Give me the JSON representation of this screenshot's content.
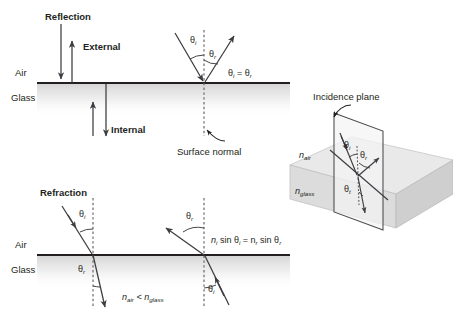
{
  "figure": {
    "title_reflection": "Reflection",
    "title_refraction": "Refraction",
    "panels": {
      "reflection": {
        "heading": "Reflection",
        "external_label": "External",
        "internal_label": "Internal",
        "medium_upper": "Air",
        "medium_lower": "Glass",
        "angle_incident": "θ",
        "angle_incident_sub": "i",
        "angle_reflected": "θ",
        "angle_reflected_sub": "r",
        "law": "θ",
        "law_sub1": "i",
        "law_eq": " = θ",
        "law_sub2": "r",
        "normal_label": "Surface normal"
      },
      "refraction": {
        "heading": "Refraction",
        "medium_upper": "Air",
        "medium_lower": "Glass",
        "left_incident": "θ",
        "left_incident_sub": "i",
        "left_refracted": "θ",
        "left_refracted_sub": "r",
        "right_refracted": "θ",
        "right_refracted_sub": "r",
        "right_incident": "θ",
        "right_incident_sub": "i",
        "snell_n1": "n",
        "snell_n1_sub": "i",
        "snell_mid": " sin θ",
        "snell_theta1_sub": "i",
        "snell_eq": " = n",
        "snell_n2_sub": "r",
        "snell_mid2": " sin θ",
        "snell_theta2_sub": "r",
        "index_compare_n1": "n",
        "index_compare_n1_sub": "air",
        "index_compare_op": " < n",
        "index_compare_n2_sub": "glass"
      },
      "incidence_plane": {
        "heading": "Incidence plane",
        "n_upper": "n",
        "n_upper_sub": "air",
        "n_lower": "n",
        "n_lower_sub": "glass",
        "angle_incident": "θ",
        "angle_incident_sub": "i",
        "angle_reflected": "θ",
        "angle_reflected_sub": "r",
        "angle_transmitted": "θ",
        "angle_transmitted_sub": "t"
      }
    },
    "colors": {
      "ink": "#231f20",
      "ray": "#3c3c41",
      "normal": "#5b5b60",
      "glass_fill": "#dcdcdc",
      "slab_top": "#e9e9e9",
      "background": "#ffffff"
    }
  }
}
